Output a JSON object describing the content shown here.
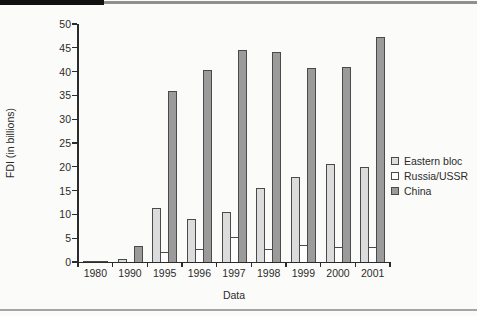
{
  "page": {
    "background": "#fbfbf9",
    "top_rule_heavy_color": "#111111",
    "top_rule_thin_color": "#8f8f8f",
    "bottom_rule_color": "#a5a5a5"
  },
  "chart_data": {
    "type": "bar",
    "title": "",
    "xlabel": "Data",
    "ylabel": "FDI (in billions)",
    "ylim": [
      0,
      50
    ],
    "ytick_step": 5,
    "grid": false,
    "legend_position": "right",
    "categories": [
      "1980",
      "1990",
      "1995",
      "1996",
      "1997",
      "1998",
      "1999",
      "2000",
      "2001"
    ],
    "series": [
      {
        "name": "Eastern bloc",
        "color": "#dcdcdc",
        "values": [
          0.1,
          0.7,
          11.4,
          9.0,
          10.6,
          15.6,
          17.9,
          20.6,
          20.0
        ]
      },
      {
        "name": "Russia/USSR",
        "color": "#ffffff",
        "values": [
          0.1,
          0.0,
          2.0,
          2.7,
          5.2,
          2.8,
          3.5,
          3.2,
          3.1
        ]
      },
      {
        "name": "China",
        "color": "#9b9b9b",
        "values": [
          0.2,
          3.3,
          36.0,
          40.3,
          44.6,
          44.2,
          40.7,
          41.0,
          47.3
        ]
      }
    ],
    "bar_outline_color": "#4a4a4a",
    "axis_color": "#2b2b2b",
    "text_color": "#2b2b2b"
  }
}
